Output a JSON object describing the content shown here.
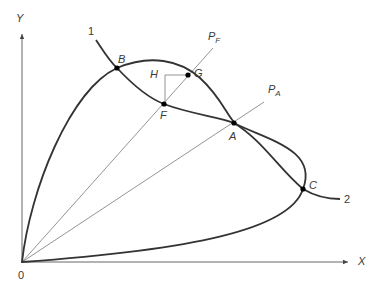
{
  "diagram": {
    "type": "two-curve intersection diagram with rays from origin",
    "axes": {
      "x_label": "X",
      "y_label": "Y",
      "origin_label": "0"
    },
    "curves": {
      "curve_1_label": "1",
      "curve_2_label": "2"
    },
    "rays": {
      "pf_main": "P",
      "pf_sub": "F",
      "pa_main": "P",
      "pa_sub": "A"
    },
    "points": {
      "B": "B",
      "G": "G",
      "H": "H",
      "F": "F",
      "A": "A",
      "C": "C"
    },
    "colors": {
      "curve": "#333333",
      "axis": "#555555",
      "ray": "#777777",
      "point": "#000000"
    }
  }
}
